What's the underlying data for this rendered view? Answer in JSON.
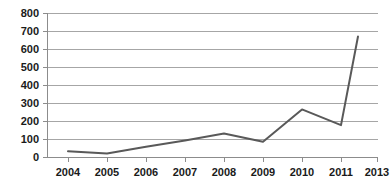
{
  "chart_data": {
    "type": "line",
    "title": "",
    "subtitle": "",
    "xlabel": "",
    "ylabel": "",
    "categories": [
      "2004",
      "2005",
      "2006",
      "2007",
      "2008",
      "2009",
      "2010",
      "2011",
      "2013"
    ],
    "values": [
      35,
      22,
      60,
      95,
      133,
      87,
      267,
      180,
      672
    ],
    "series": [
      {
        "name": "",
        "values": [
          35,
          22,
          60,
          95,
          133,
          87,
          267,
          180,
          672
        ]
      }
    ],
    "ylim": [
      0,
      800
    ],
    "ytick_labels": [
      "0",
      "100",
      "200",
      "300",
      "400",
      "500",
      "600",
      "700",
      "800"
    ],
    "ytick_values": [
      0,
      100,
      200,
      300,
      400,
      500,
      600,
      700,
      800
    ],
    "xtick_labels": [
      "2004",
      "2005",
      "2006",
      "2007",
      "2008",
      "2009",
      "2010",
      "2011",
      "2013"
    ],
    "grid": true,
    "grid_axis": "y",
    "legend": false,
    "legend_position": "none",
    "line_color": "#595959",
    "grid_color": "#a6a6a6",
    "axis_color": "#8c8c8c",
    "background_color": "#ffffff",
    "text_color": "#1a1a1a",
    "annotations": []
  }
}
